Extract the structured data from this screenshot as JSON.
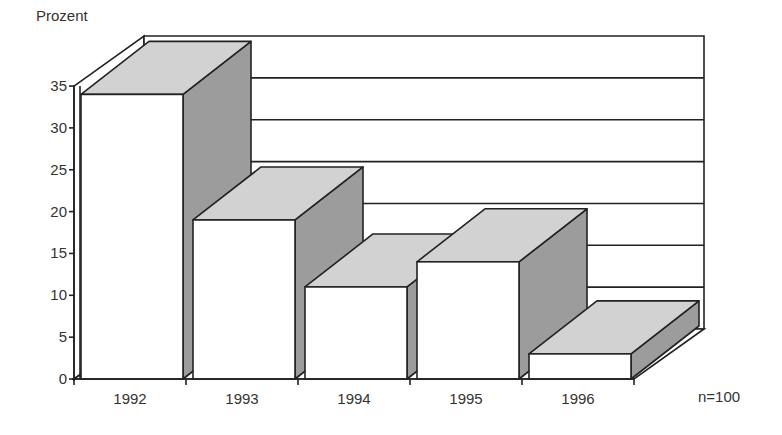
{
  "chart_data": {
    "type": "bar",
    "style": "3d",
    "title": "",
    "ylabel": "Prozent",
    "xlabel": "",
    "categories": [
      "1992",
      "1993",
      "1994",
      "1995",
      "1996"
    ],
    "values": [
      34,
      19,
      11,
      14,
      3
    ],
    "ylim": [
      0,
      35
    ],
    "yticks": [
      0,
      5,
      10,
      15,
      20,
      25,
      30,
      35
    ],
    "ytick_labels": [
      "0",
      "5",
      "10",
      "15",
      "20",
      "25",
      "30",
      "35"
    ],
    "grid": true,
    "annotation": "n=100",
    "colors": {
      "front": "#ffffff",
      "top": "#d2d2d2",
      "side": "#9c9c9c",
      "line": "#222222",
      "text": "#333333"
    }
  }
}
